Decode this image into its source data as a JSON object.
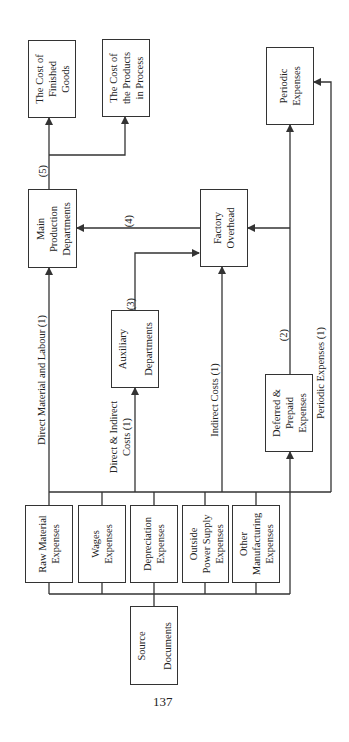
{
  "diagram": {
    "boxes": {
      "finished_goods": "The Cost of\nFinished\nGoods",
      "products_in_process": "The Cost of\nthe Products\nin Process",
      "periodic_expenses": "Periodic\nExpenses",
      "main_production": "Main\nProduction\nDepartments",
      "factory_overhead": "Factory\nOverhead",
      "auxiliary": "Auxiliary\n\nDepartments",
      "deferred_prepaid": "Deferred &\nPrepaid\nExpenses",
      "raw_material": "Raw Material\nExpenses",
      "wages": "Wages\nExpenses",
      "depreciation": "Depreciation\nExpenses",
      "outside_power": "Outside\nPower Supply\nExpenses",
      "other_manufacturing": "Other\nManufacturing\nExpenses",
      "source_documents": "Source\n\nDocuments"
    },
    "edge_labels": {
      "direct_material_labour": "Direct Material and Labour (1)",
      "direct_indirect_costs": "Direct & Indirect\nCosts (1)",
      "indirect_costs": "Indirect Costs (1)",
      "periodic_expenses_flow": "Periodic Expenses (1)",
      "step2": "(2)",
      "step3": "(3)",
      "step4": "(4)",
      "step5": "(5)"
    },
    "page_number": "137",
    "colors": {
      "line": "#333333",
      "background": "#ffffff"
    }
  }
}
